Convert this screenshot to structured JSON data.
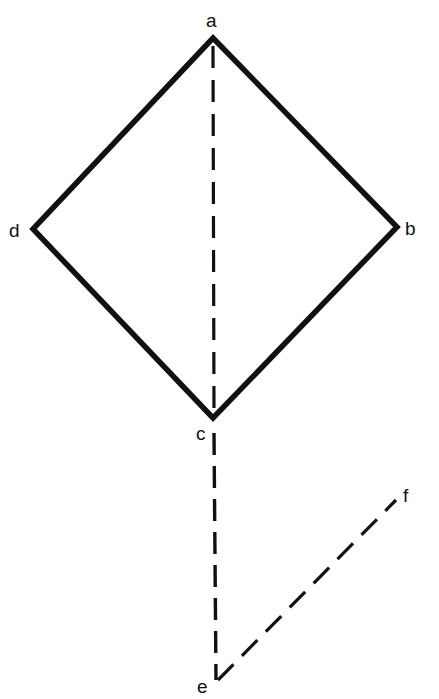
{
  "diagram": {
    "type": "geometric-figure",
    "colors": {
      "stroke": "#111111",
      "background": "#ffffff"
    },
    "points": {
      "a": {
        "label": "a",
        "x": 213,
        "y": 38
      },
      "b": {
        "label": "b",
        "x": 397,
        "y": 227
      },
      "c": {
        "label": "c",
        "x": 213,
        "y": 418
      },
      "d": {
        "label": "d",
        "x": 33,
        "y": 229
      },
      "e": {
        "label": "e",
        "x": 216,
        "y": 683
      },
      "f": {
        "label": "f",
        "x": 397,
        "y": 500
      }
    },
    "solid_edges": [
      {
        "from": "a",
        "to": "b"
      },
      {
        "from": "b",
        "to": "c"
      },
      {
        "from": "c",
        "to": "d"
      },
      {
        "from": "d",
        "to": "a"
      }
    ],
    "dashed_edges": [
      {
        "from": "a",
        "to": "c"
      },
      {
        "from": "c",
        "to": "e"
      },
      {
        "from": "e",
        "to": "f"
      }
    ],
    "labels": {
      "a": "a",
      "b": "b",
      "c": "c",
      "d": "d",
      "e": "e",
      "f": "f"
    }
  }
}
